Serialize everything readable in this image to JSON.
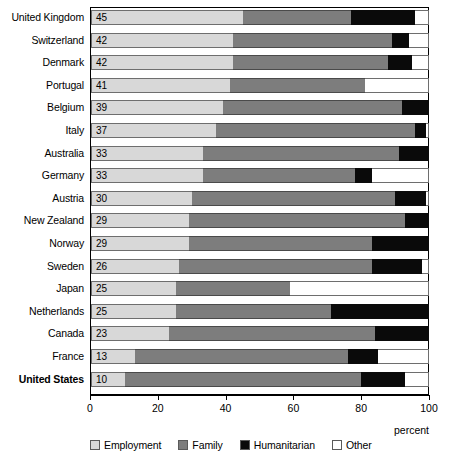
{
  "chart_data": {
    "type": "bar",
    "orientation": "horizontal",
    "stacked": true,
    "title": "",
    "xlabel": "percent",
    "ylabel": "",
    "xlim": [
      0,
      100
    ],
    "xticks": [
      0,
      20,
      40,
      60,
      80,
      100
    ],
    "xtick_labels": [
      "0",
      "20",
      "40",
      "60",
      "80",
      "100"
    ],
    "grid": false,
    "legend_position": "bottom",
    "series": [
      {
        "name": "Employment",
        "color": "#d8d8d8",
        "values": [
          45,
          42,
          42,
          41,
          39,
          37,
          33,
          33,
          30,
          29,
          29,
          26,
          25,
          25,
          23,
          13,
          10
        ]
      },
      {
        "name": "Family",
        "color": "#7d7d7d",
        "values": [
          32,
          47,
          46,
          40,
          53,
          59,
          58,
          45,
          60,
          64,
          54,
          57,
          34,
          46,
          61,
          63,
          70
        ]
      },
      {
        "name": "Humanitarian",
        "color": "#0a0a0a",
        "values": [
          19,
          5,
          7,
          0,
          8,
          3,
          9,
          5,
          9,
          7,
          17,
          15,
          0,
          29,
          16,
          9,
          13
        ]
      },
      {
        "name": "Other",
        "color": "#ffffff",
        "values": [
          4,
          6,
          5,
          19,
          0,
          1,
          0,
          17,
          1,
          0,
          0,
          2,
          41,
          0,
          0,
          15,
          7
        ]
      }
    ],
    "categories": [
      "United Kingdom",
      "Switzerland",
      "Denmark",
      "Portugal",
      "Belgium",
      "Italy",
      "Australia",
      "Germany",
      "Austria",
      "New Zealand",
      "Norway",
      "Sweden",
      "Japan",
      "Netherlands",
      "Canada",
      "France",
      "United States"
    ],
    "highlighted_category": "United States",
    "bar_value_labels": [
      "45",
      "42",
      "42",
      "41",
      "39",
      "37",
      "33",
      "33",
      "30",
      "29",
      "29",
      "26",
      "25",
      "25",
      "23",
      "13",
      "10"
    ]
  },
  "legend": {
    "items": [
      {
        "label": "Employment",
        "color": "#d8d8d8"
      },
      {
        "label": "Family",
        "color": "#7d7d7d"
      },
      {
        "label": "Humanitarian",
        "color": "#0a0a0a"
      },
      {
        "label": "Other",
        "color": "#ffffff"
      }
    ]
  },
  "axis": {
    "x_title": "percent",
    "tick_labels": [
      "0",
      "20",
      "40",
      "60",
      "80",
      "100"
    ]
  }
}
